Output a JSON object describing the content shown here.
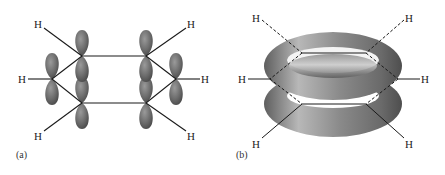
{
  "panels": [
    {
      "id": "a",
      "caption": "(a)",
      "description": "Benzene p orbitals, side view",
      "hydrogen_labels": [
        "H",
        "H",
        "H",
        "H",
        "H",
        "H"
      ]
    },
    {
      "id": "b",
      "caption": "(b)",
      "description": "Delocalized pi electron clouds (torus above and below ring)",
      "hydrogen_labels": [
        "H",
        "H",
        "H",
        "H",
        "H",
        "H"
      ]
    }
  ],
  "colors": {
    "orbital": "#6e6e6e",
    "bond": "#1a1a1a",
    "text": "#222222"
  }
}
